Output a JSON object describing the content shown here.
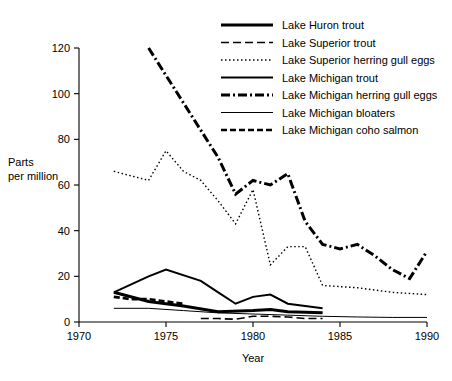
{
  "chart_data": {
    "type": "line",
    "title": "",
    "xlabel": "Year",
    "ylabel": "Parts per million",
    "ylabel_lines": [
      "Parts",
      "per million"
    ],
    "xlim": [
      1970,
      1990
    ],
    "ylim": [
      0,
      120
    ],
    "xticks": [
      1970,
      1975,
      1980,
      1985,
      1990
    ],
    "yticks": [
      0,
      20,
      40,
      60,
      80,
      100,
      120
    ],
    "xtick_labels": [
      "1970",
      "1975",
      "1980",
      "1985",
      "1990"
    ],
    "ytick_labels": [
      "0",
      "20",
      "40",
      "60",
      "80",
      "100",
      "120"
    ],
    "grid": false,
    "legend_position": "top-right",
    "series": [
      {
        "name": "Lake Huron trout",
        "style": "thick-solid",
        "x": [
          1972,
          1974,
          1976,
          1978,
          1980,
          1981,
          1982,
          1984
        ],
        "values": [
          13,
          9,
          7,
          4.5,
          5,
          5.5,
          4.5,
          4
        ]
      },
      {
        "name": "Lake Superior trout",
        "style": "dashed",
        "x": [
          1977,
          1978,
          1979,
          1980,
          1981,
          1982,
          1983,
          1984
        ],
        "values": [
          1.5,
          1.5,
          1.2,
          2.5,
          2.5,
          2.2,
          1.5,
          1.5
        ]
      },
      {
        "name": "Lake Superior herring gull eggs",
        "style": "dotted",
        "x": [
          1972,
          1974,
          1975,
          1976,
          1977,
          1978,
          1979,
          1980,
          1981,
          1982,
          1983,
          1984,
          1986,
          1988,
          1990
        ],
        "values": [
          66,
          62,
          75,
          66,
          62,
          53,
          43,
          58,
          25,
          33,
          33,
          16,
          15,
          13,
          12
        ]
      },
      {
        "name": "Lake Michigan trout",
        "style": "solid",
        "x": [
          1972,
          1974,
          1975,
          1977,
          1978,
          1979,
          1980,
          1981,
          1982,
          1984
        ],
        "values": [
          13,
          20,
          23,
          18,
          13,
          8,
          11,
          12,
          8,
          6
        ]
      },
      {
        "name": "Lake Michigan herring gull eggs",
        "style": "dash-dot",
        "x": [
          1974,
          1978,
          1979,
          1980,
          1981,
          1982,
          1983,
          1984,
          1985,
          1986,
          1987,
          1988,
          1989,
          1990
        ],
        "values": [
          120,
          72,
          56,
          62,
          60,
          65,
          44,
          34,
          32,
          34,
          29,
          23,
          19,
          31
        ]
      },
      {
        "name": "Lake Michigan bloaters",
        "style": "thin-solid",
        "x": [
          1972,
          1974,
          1976,
          1978,
          1980,
          1982,
          1984,
          1986,
          1988,
          1990
        ],
        "values": [
          6,
          6,
          5,
          4,
          3.5,
          3,
          2.5,
          2.2,
          2,
          2
        ]
      },
      {
        "name": "Lake Michigan coho salmon",
        "style": "thick-dashed",
        "x": [
          1972,
          1973,
          1974,
          1975,
          1976
        ],
        "values": [
          11,
          10,
          10,
          9,
          8
        ]
      }
    ]
  },
  "legend": {
    "items": [
      {
        "label": "Lake Huron trout",
        "style": "thick-solid"
      },
      {
        "label": "Lake Superior trout",
        "style": "dashed"
      },
      {
        "label": "Lake Superior herring gull eggs",
        "style": "dotted"
      },
      {
        "label": "Lake Michigan trout",
        "style": "solid"
      },
      {
        "label": "Lake Michigan herring gull eggs",
        "style": "dash-dot"
      },
      {
        "label": "Lake Michigan bloaters",
        "style": "thin-solid"
      },
      {
        "label": "Lake Michigan coho salmon",
        "style": "thick-dashed"
      }
    ]
  }
}
